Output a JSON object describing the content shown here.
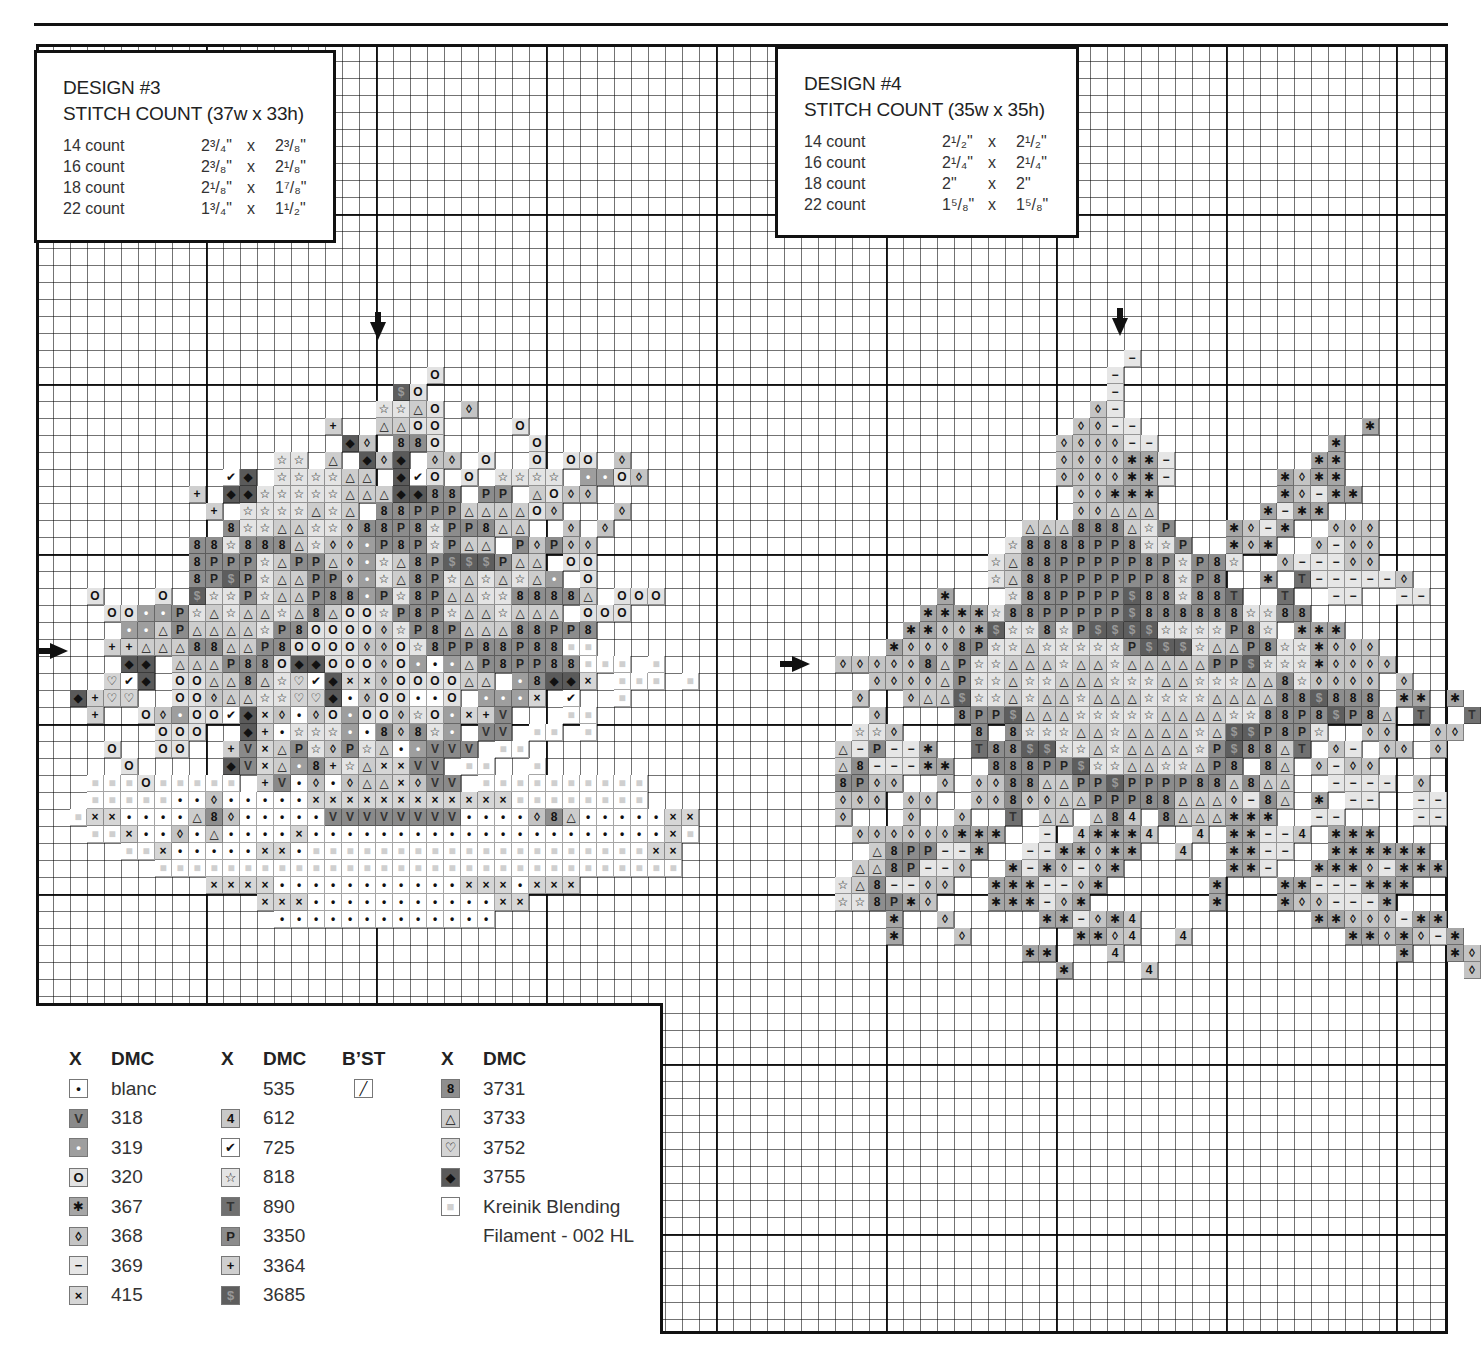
{
  "page": {
    "top_rule": true
  },
  "designs": [
    {
      "id": "design3",
      "title": "DESIGN #3",
      "stitch_count": "STITCH COUNT (37w x 33h)",
      "sizes": [
        {
          "count": "14 count",
          "w": "2³/₄\"",
          "x": "x",
          "h": "2³/₈\""
        },
        {
          "count": "16 count",
          "w": "2³/₈\"",
          "x": "x",
          "h": "2¹/₈\""
        },
        {
          "count": "18 count",
          "w": "2¹/₈\"",
          "x": "x",
          "h": "1⁷/₈\""
        },
        {
          "count": "22 count",
          "w": "1³/₄\"",
          "x": "x",
          "h": "1¹/₂\""
        }
      ],
      "center_arrows": {
        "top": {
          "x": 378,
          "y": 312
        },
        "left": {
          "x": 38,
          "y": 651
        }
      },
      "stitches": {
        "origin_col": 0,
        "origin_row": 0,
        "rows": [
          {
            "r": 19,
            "c": 23,
            "s": "O"
          },
          {
            "r": 20,
            "c": 21,
            "s": "$O"
          },
          {
            "r": 21,
            "c": 20,
            "s": "ssAO d"
          },
          {
            "r": 22,
            "c": 17,
            "s": "+  AAOO    O"
          },
          {
            "r": 23,
            "c": 18,
            "s": "Dd 88O     O"
          },
          {
            "r": 24,
            "c": 14,
            "s": "ss A DdD dd O  O OO d"
          },
          {
            "r": 25,
            "c": 11,
            "s": "cD ssssAA DcO O ssss ooOd"
          },
          {
            "r": 26,
            "c": 9,
            "s": "+ DDsssssAAADD88 PP AOdd"
          },
          {
            "r": 27,
            "c": 10,
            "s": "+ ssssAsA 88PPPAAAAOd   d"
          },
          {
            "r": 28,
            "c": 11,
            "s": "8ssAAssd88P8sPP8AA  d d"
          },
          {
            "r": 29,
            "c": 9,
            "s": "88s888AsddoP8PsPAA PdPdd"
          },
          {
            "r": 30,
            "c": 9,
            "s": "8PPPsAPPAdosA8P$$$PAA OO"
          },
          {
            "r": 31,
            "c": 9,
            "s": "8P$PsAAPPdosA8PsAsAsAo O"
          },
          {
            "r": 32,
            "c": 3,
            "s": "O   O $ssPsAAP88oPs8PAAss8888A OOO"
          },
          {
            "r": 33,
            "c": 4,
            "s": "OOooPsAsAAsA8AOOsP8PsAAsAAA OOO"
          },
          {
            "r": 34,
            "c": 5,
            "s": "ooAPAAAAsP8OOOOdsP8PAAA88PP8"
          },
          {
            "r": 35,
            "c": 4,
            "s": "++AAA88AAP8OOOOddOs8PP88P88kk"
          },
          {
            "r": 36,
            "c": 5,
            "s": "DD AAAP88ODDOOOdOo.oAP8PP88kkk k"
          },
          {
            "r": 37,
            "c": 4,
            "s": "hcD OOAA8AshcDxxdOOOOAA o8DDx kkk k"
          },
          {
            "r": 38,
            "c": 2,
            "s": "D+hh  OOdAAsshhD.dOO..O ooox c  k"
          },
          {
            "r": 39,
            "c": 3,
            "s": "+  OdoOOcDxd.dOoOOdsOox+V   kk"
          },
          {
            "r": 40,
            "c": 7,
            "s": "OOO  D+.ssso.8d8so VV kk k"
          },
          {
            "r": 41,
            "c": 4,
            "s": "O  OO  +VxAPsdPsA.oVVV kk"
          },
          {
            "r": 42,
            "c": 5,
            "s": "O     DVxAo8+sAxxVV kk  k"
          },
          {
            "r": 43,
            "c": 3,
            "s": "kkkOkkkkk +V.d.dAAxdVV kkkkkkkkkk"
          },
          {
            "r": 44,
            "c": 3,
            "s": "kkkkk..d.....xxxxxxxxxxxxkkkkkkkk"
          },
          {
            "r": 45,
            "c": 2,
            "s": "kxx....A8d.....VVVVVVVV....d8A.....xx"
          },
          {
            "r": 46,
            "c": 3,
            "s": "kkx..d.A....x.....................xk"
          },
          {
            "r": 47,
            "c": 5,
            "s": "kkx.....xx.kkkkkkkkkkkkkkkkkkkkxx"
          },
          {
            "r": 48,
            "c": 7,
            "s": "kkkkkkkkkkkkkkkkkkkkkkkkkkkkkkk"
          },
          {
            "r": 49,
            "c": 10,
            "s": "xxxx...........xxx.xxx"
          },
          {
            "r": 50,
            "c": 13,
            "s": "xxx...........xx"
          },
          {
            "r": 51,
            "c": 14,
            "s": "............."
          }
        ]
      }
    },
    {
      "id": "design4",
      "title": "DESIGN #4",
      "stitch_count": "STITCH COUNT (35w x 35h)",
      "sizes": [
        {
          "count": "14 count",
          "w": "2¹/₂\"",
          "x": "x",
          "h": "2¹/₂\""
        },
        {
          "count": "16 count",
          "w": "2¹/₄\"",
          "x": "x",
          "h": "2¹/₄\""
        },
        {
          "count": "18 count",
          "w": "2\"",
          "x": "x",
          "h": "2\""
        },
        {
          "count": "22 count",
          "w": "1⁵/₈\"",
          "x": "x",
          "h": "1⁵/₈\""
        }
      ],
      "center_arrows": {
        "top": {
          "x": 1120,
          "y": 307
        },
        "left": {
          "x": 780,
          "y": 664
        }
      },
      "stitches": {
        "rows": [
          {
            "r": 18,
            "c": 64,
            "s": "-"
          },
          {
            "r": 19,
            "c": 63,
            "s": "-"
          },
          {
            "r": 20,
            "c": 63,
            "s": "-"
          },
          {
            "r": 21,
            "c": 62,
            "s": "d-"
          },
          {
            "r": 22,
            "c": 61,
            "s": "dd--             *"
          },
          {
            "r": 23,
            "c": 60,
            "s": "dddd--          *"
          },
          {
            "r": 24,
            "c": 60,
            "s": "dddd**-        **"
          },
          {
            "r": 25,
            "c": 60,
            "s": "dddd**-      *d**"
          },
          {
            "r": 26,
            "c": 61,
            "s": "dd***       *d-**"
          },
          {
            "r": 27,
            "c": 61,
            "s": "ddAAA      *-**"
          },
          {
            "r": 28,
            "c": 58,
            "s": "AAA888AsP   *d-*  ddd"
          },
          {
            "r": 29,
            "c": 57,
            "s": "s8888PP8ssP  *d*  d-dd"
          },
          {
            "r": 30,
            "c": 56,
            "s": "sA88PPPPP8PsP8s  d---dd"
          },
          {
            "r": 31,
            "c": 56,
            "s": "sA88PPPPPP8sP8  * T-----d"
          },
          {
            "r": 32,
            "c": 53,
            "s": "*   s88PPPP$88s88T  T  --  --"
          },
          {
            "r": 33,
            "c": 52,
            "s": "****s88PPPPP$888888ss88   "
          },
          {
            "r": 34,
            "c": 51,
            "s": "**dd*$ss8sP$$$$ssssP8s ***"
          },
          {
            "r": 35,
            "c": 50,
            "s": "*ddd8PssAsssssP$$$sAAP8ss*ddd"
          },
          {
            "r": 36,
            "c": 47,
            "s": "ddddd8APssAAAsAAsAAAAAPP$sss*dddd"
          },
          {
            "r": 37,
            "c": 49,
            "s": "ddddAPssAssAAAsssAAsssAA8sdddd d"
          },
          {
            "r": 38,
            "c": 48,
            "s": "d  dAA$ssAsAAsAAAssssAAAA88$888 ** *"
          },
          {
            "r": 39,
            "c": 49,
            "s": "d    8PP$AAAsssssAAAAss88P8$P8A T  T"
          },
          {
            "r": 40,
            "c": 48,
            "s": "ssd    8 8sssAAsAAAAsA$$P8Ps  dd  dd"
          },
          {
            "r": 41,
            "c": 47,
            "s": "A-P--*  T88$$ssAsAAAAsP$88AT d- dd d"
          },
          {
            "r": 42,
            "c": 47,
            "s": "A8---**  888PP$ssAAssAP8 8A d-dd"
          },
          {
            "r": 43,
            "c": 47,
            "s": "8Pdd  d dd88AAPP$PPPP88A8AA  ---- d"
          },
          {
            "r": 44,
            "c": 47,
            "s": "ddd dd  dd8ddAAPPP88AAAd-8A * --  --"
          },
          {
            "r": 45,
            "c": 47,
            "s": "d   d  d  T AA A84 8AAA***  --    --"
          },
          {
            "r": 46,
            "c": 48,
            "s": "dddddd***  - 4***4  4 **--4 ***"
          },
          {
            "r": 47,
            "c": 49,
            "s": "A8PP--*  --**d**  4  **--  ******"
          },
          {
            "r": 48,
            "c": 48,
            "s": "AA8P--d  *-*d-d*      **-  ***d-***"
          },
          {
            "r": 49,
            "c": 47,
            "s": "sA8--dd  ***--d*      *   **---***"
          },
          {
            "r": 50,
            "c": 47,
            "s": "ss8P*d   ***-d*       *   *dd---*"
          },
          {
            "r": 51,
            "c": 50,
            "s": "*  d     **-d*4          **ddd-**"
          },
          {
            "r": 52,
            "c": 50,
            "s": "*   d      **d4  4         **d*d-*"
          },
          {
            "r": 53,
            "c": 58,
            "s": "**   4                *  *d"
          },
          {
            "r": 54,
            "c": 60,
            "s": "*    4                  d"
          }
        ]
      }
    }
  ],
  "legend": {
    "columns": [
      {
        "headers": [
          "X",
          "DMC"
        ],
        "items": [
          {
            "sym": "•",
            "code": "blanc",
            "fill": "#ffffff",
            "fg": "#111"
          },
          {
            "sym": "V",
            "code": "318",
            "fill": "#8a8a8a",
            "fg": "#333"
          },
          {
            "sym": "•",
            "code": "319",
            "fill": "#9e9e9e",
            "fg": "#fff"
          },
          {
            "sym": "O",
            "code": "320",
            "fill": "#e2e2e2",
            "fg": "#111"
          },
          {
            "sym": "✱",
            "code": "367",
            "fill": "#a6a6a6",
            "fg": "#111"
          },
          {
            "sym": "◊",
            "code": "368",
            "fill": "#c4c4c4",
            "fg": "#111"
          },
          {
            "sym": "−",
            "code": "369",
            "fill": "#e6e6e6",
            "fg": "#111"
          },
          {
            "sym": "×",
            "code": "415",
            "fill": "#d6d6d6",
            "fg": "#111"
          }
        ]
      },
      {
        "headers": [
          "X",
          "DMC"
        ],
        "items": [
          {
            "sym": "",
            "code": "535",
            "fill": "",
            "fg": ""
          },
          {
            "sym": "4",
            "code": "612",
            "fill": "#c8c8c8",
            "fg": "#111"
          },
          {
            "sym": "✔",
            "code": "725",
            "fill": "#ffffff",
            "fg": "#111"
          },
          {
            "sym": "☆",
            "code": "818",
            "fill": "#e4e4e4",
            "fg": "#111"
          },
          {
            "sym": "T",
            "code": "890",
            "fill": "#707070",
            "fg": "#333"
          },
          {
            "sym": "P",
            "code": "3350",
            "fill": "#8c8c8c",
            "fg": "#222"
          },
          {
            "sym": "+",
            "code": "3364",
            "fill": "#cfcfcf",
            "fg": "#111"
          },
          {
            "sym": "$",
            "code": "3685",
            "fill": "#5e5e5e",
            "fg": "#999"
          }
        ]
      },
      {
        "headers": [
          "B’ST"
        ],
        "items": [
          {
            "sym": "╱",
            "code": "",
            "fill": "#ffffff",
            "fg": "#111"
          }
        ]
      },
      {
        "headers": [
          "X",
          "DMC"
        ],
        "items": [
          {
            "sym": "8",
            "code": "3731",
            "fill": "#8e8e8e",
            "fg": "#111"
          },
          {
            "sym": "△",
            "code": "3733",
            "fill": "#cdcdcd",
            "fg": "#111"
          },
          {
            "sym": "♡",
            "code": "3752",
            "fill": "#d4d4d4",
            "fg": "#111"
          },
          {
            "sym": "◆",
            "code": "3755",
            "fill": "#5a5a5a",
            "fg": "#111"
          },
          {
            "sym": "■",
            "code": "Kreinik Blending",
            "fill": "#ffffff",
            "fg": "#d0d0d0"
          },
          {
            "sym": "",
            "code": "Filament - 002 HL",
            "fill": "",
            "fg": ""
          }
        ]
      }
    ]
  },
  "symbol_map": {
    ".": {
      "glyph": "•",
      "fill": "#ffffff",
      "fg": "#111"
    },
    "V": {
      "glyph": "V",
      "fill": "#8a8a8a",
      "fg": "#333"
    },
    "o": {
      "glyph": "•",
      "fill": "#9e9e9e",
      "fg": "#fff"
    },
    "O": {
      "glyph": "O",
      "fill": "#e2e2e2",
      "fg": "#111"
    },
    "*": {
      "glyph": "✱",
      "fill": "#a6a6a6",
      "fg": "#111"
    },
    "d": {
      "glyph": "◊",
      "fill": "#c4c4c4",
      "fg": "#111"
    },
    "-": {
      "glyph": "−",
      "fill": "#e6e6e6",
      "fg": "#111"
    },
    "x": {
      "glyph": "×",
      "fill": "#d6d6d6",
      "fg": "#111"
    },
    "4": {
      "glyph": "4",
      "fill": "#c8c8c8",
      "fg": "#111"
    },
    "c": {
      "glyph": "✔",
      "fill": "#ffffff",
      "fg": "#111"
    },
    "s": {
      "glyph": "☆",
      "fill": "#e4e4e4",
      "fg": "#111"
    },
    "T": {
      "glyph": "T",
      "fill": "#707070",
      "fg": "#333"
    },
    "P": {
      "glyph": "P",
      "fill": "#8c8c8c",
      "fg": "#222"
    },
    "+": {
      "glyph": "+",
      "fill": "#cfcfcf",
      "fg": "#111"
    },
    "$": {
      "glyph": "$",
      "fill": "#5e5e5e",
      "fg": "#999"
    },
    "8": {
      "glyph": "8",
      "fill": "#8e8e8e",
      "fg": "#111"
    },
    "A": {
      "glyph": "△",
      "fill": "#cdcdcd",
      "fg": "#111"
    },
    "h": {
      "glyph": "♡",
      "fill": "#d4d4d4",
      "fg": "#111"
    },
    "D": {
      "glyph": "◆",
      "fill": "#5a5a5a",
      "fg": "#111"
    },
    "k": {
      "glyph": "■",
      "fill": "#ffffff",
      "fg": "#cfcfcf"
    }
  },
  "grid": {
    "origin_x": 36,
    "origin_y": 44,
    "cell": 17
  }
}
